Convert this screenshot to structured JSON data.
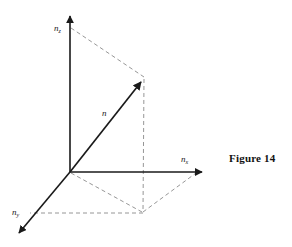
{
  "figure": {
    "caption": "Figure 14",
    "caption_position": {
      "x": 229,
      "y": 152
    },
    "background_color": "#ffffff",
    "line_color": "#1a1a1a",
    "dashed_color": "#8a8a8a"
  },
  "axes": [
    {
      "id": "z",
      "label_base": "n",
      "label_sub": "z",
      "label_x": 54,
      "label_y": 31,
      "from": {
        "x": 70,
        "y": 172
      },
      "to": {
        "x": 70,
        "y": 13
      },
      "arrow": true,
      "style": "solid"
    },
    {
      "id": "x",
      "label_base": "n",
      "label_sub": "x",
      "label_x": 181,
      "label_y": 162,
      "from": {
        "x": 70,
        "y": 172
      },
      "to": {
        "x": 206,
        "y": 172
      },
      "arrow": true,
      "style": "solid"
    },
    {
      "id": "y",
      "label_base": "n",
      "label_sub": "y",
      "label_x": 12,
      "label_y": 215,
      "from": {
        "x": 70,
        "y": 172
      },
      "to": {
        "x": 16,
        "y": 236
      },
      "arrow": true,
      "style": "solid"
    }
  ],
  "vector": {
    "label": "n",
    "label_x": 102,
    "label_y": 116,
    "from": {
      "x": 70,
      "y": 172
    },
    "to": {
      "x": 144,
      "y": 78
    },
    "arrow": true,
    "style": "solid"
  },
  "projection_point": {
    "x": 143,
    "y": 213
  },
  "dashed_lines": [
    {
      "name": "z-axis-to-tip",
      "from": {
        "x": 71,
        "y": 28
      },
      "to": {
        "x": 144,
        "y": 77
      }
    },
    {
      "name": "tip-to-xy-plane",
      "from": {
        "x": 144,
        "y": 79
      },
      "to": {
        "x": 143,
        "y": 212
      }
    },
    {
      "name": "xy-point-to-x-axis",
      "from": {
        "x": 143,
        "y": 212
      },
      "to": {
        "x": 196,
        "y": 173
      }
    },
    {
      "name": "xy-point-to-y-axis",
      "from": {
        "x": 143,
        "y": 213
      },
      "to": {
        "x": 30,
        "y": 213
      }
    },
    {
      "name": "origin-to-xy-point",
      "from": {
        "x": 71,
        "y": 173
      },
      "to": {
        "x": 142,
        "y": 212
      }
    }
  ]
}
